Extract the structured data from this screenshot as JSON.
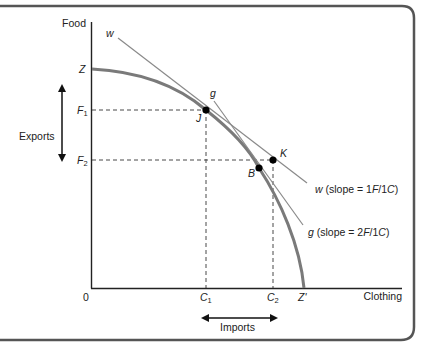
{
  "figure": {
    "axes": {
      "y_label": "Food",
      "x_label": "Clothing",
      "origin_label": "0"
    },
    "y_ticks": {
      "Z": "Z",
      "F1": "F",
      "F1_sub": "1",
      "F2": "F",
      "F2_sub": "2"
    },
    "x_ticks": {
      "C1": "C",
      "C1_sub": "1",
      "C2": "C",
      "C2_sub": "2",
      "Zprime": "Z'"
    },
    "points": {
      "J": "J",
      "K": "K",
      "B": "B"
    },
    "lines": {
      "w_label": "w",
      "g_label": "g",
      "w_legend_prefix": "w",
      "w_legend_text": " (slope = 1",
      "w_legend_F": "F",
      "w_legend_mid": "/1",
      "w_legend_C": "C",
      "w_legend_close": ")",
      "g_legend_prefix": "g",
      "g_legend_text": " (slope = 2",
      "g_legend_F": "F",
      "g_legend_mid": "/1",
      "g_legend_C": "C",
      "g_legend_close": ")"
    },
    "annotations": {
      "exports": "Exports",
      "imports": "Imports"
    },
    "colors": {
      "curve": "#7a7a7a",
      "lines": "#8a8a8a",
      "axes": "#222222",
      "frame": "#555555"
    }
  }
}
